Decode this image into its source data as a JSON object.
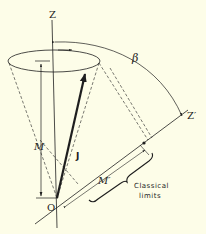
{
  "diagram": {
    "type": "vector-model-projection",
    "background": "#fdfde8",
    "ink": "#1e1e1e",
    "labels": {
      "z_axis": "Z",
      "z_prime_axis": "Z′",
      "origin": "O",
      "angle": "β",
      "vector": "J",
      "projection_z": "M",
      "projection_z_prime": "M′",
      "classical_line1": "Classical",
      "classical_line2": "limits"
    }
  }
}
